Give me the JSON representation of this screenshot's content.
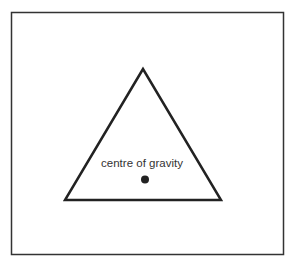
{
  "diagram": {
    "label": "centre of gravity",
    "colors": {
      "stroke": "#222222",
      "dot": "#222222",
      "text": "#333333",
      "background": "#ffffff"
    }
  }
}
